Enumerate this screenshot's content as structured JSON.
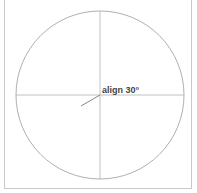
{
  "diagram": {
    "label": "align 30°",
    "angle_degrees": 30,
    "colors": {
      "circle": "#9a9a9a",
      "axes": "#b0b0b0",
      "pointer": "#888888",
      "frame": "#c8c8c8",
      "text": "#444444"
    }
  }
}
